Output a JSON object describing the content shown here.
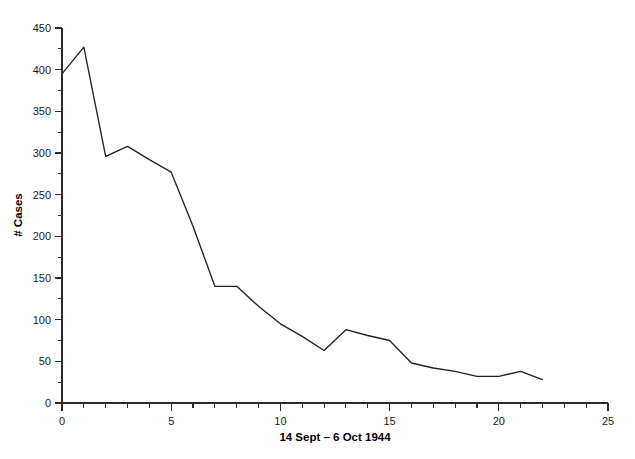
{
  "chart_data": {
    "type": "line",
    "title": "",
    "subtitle": "",
    "xlabel": "14 Sept – 6 Oct 1944",
    "ylabel": "# Cases",
    "xlim": [
      0,
      25
    ],
    "ylim": [
      0,
      450
    ],
    "x_major_ticks": [
      0,
      5,
      10,
      15,
      20,
      25
    ],
    "x_major_tick_labels": [
      "0",
      "5",
      "10",
      "15",
      "20",
      "25"
    ],
    "x_minor_tick_step": 1,
    "y_major_ticks": [
      0,
      50,
      100,
      150,
      200,
      250,
      300,
      350,
      400,
      450
    ],
    "y_major_tick_labels": [
      "0",
      "50",
      "100",
      "150",
      "200",
      "250",
      "300",
      "350",
      "400",
      "450"
    ],
    "y_minor_tick_step": 25,
    "grid": false,
    "legend": false,
    "legend_position": "none",
    "line_color": "#222222",
    "axis_color": "#2b2b2b",
    "background_color": "#ffffff",
    "x": [
      0,
      1,
      2,
      3,
      4,
      5,
      6,
      7,
      8,
      9,
      10,
      11,
      12,
      13,
      14,
      15,
      16,
      17,
      18,
      19,
      20,
      21,
      22
    ],
    "values": [
      395,
      427,
      296,
      308,
      292,
      277,
      212,
      140,
      140,
      116,
      95,
      80,
      63,
      88,
      81,
      75,
      48,
      42,
      38,
      32,
      32,
      38,
      28
    ],
    "series": [
      {
        "name": "# Cases",
        "values": [
          395,
          427,
          296,
          308,
          292,
          277,
          212,
          140,
          140,
          116,
          95,
          80,
          63,
          88,
          81,
          75,
          48,
          42,
          38,
          32,
          32,
          38,
          28
        ]
      }
    ]
  },
  "figure": {
    "ylabel": "# Cases",
    "xlabel": "14 Sept – 6 Oct 1944"
  }
}
